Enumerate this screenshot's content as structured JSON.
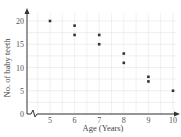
{
  "chart_data": {
    "type": "scatter",
    "title": "",
    "xlabel": "Age (Years)",
    "ylabel": "No. of baby teeth",
    "x_ticks": [
      5,
      6,
      7,
      8,
      9,
      10
    ],
    "y_ticks": [
      0,
      5,
      10,
      15,
      20
    ],
    "xlim": [
      4,
      10
    ],
    "ylim": [
      0,
      22
    ],
    "grid": true,
    "axis_break_x": true,
    "points": [
      {
        "x": 5,
        "y": 20
      },
      {
        "x": 6,
        "y": 19
      },
      {
        "x": 6,
        "y": 17
      },
      {
        "x": 7,
        "y": 17
      },
      {
        "x": 7,
        "y": 15
      },
      {
        "x": 8,
        "y": 13
      },
      {
        "x": 8,
        "y": 11
      },
      {
        "x": 9,
        "y": 8
      },
      {
        "x": 9,
        "y": 7
      },
      {
        "x": 10,
        "y": 5
      }
    ],
    "colors": {
      "axis": "#333333",
      "grid": "#e6e6e6",
      "point": "#333333"
    }
  }
}
